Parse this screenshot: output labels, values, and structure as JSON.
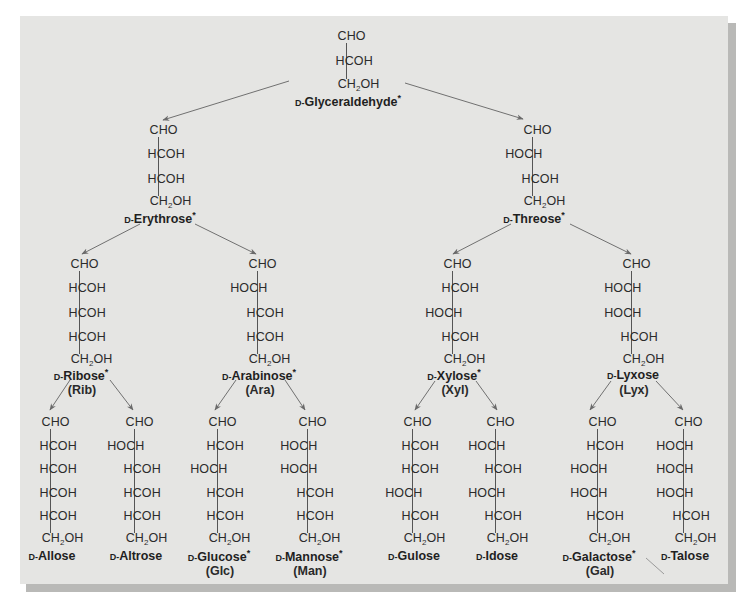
{
  "figure": {
    "colors": {
      "panel": "#e5e5e3",
      "shadow": "#b9b9b7",
      "text": "#2b2b2b",
      "arrow": "#707070"
    }
  },
  "molecules": [
    {
      "id": "glyceraldehyde",
      "prefix": "D-",
      "name": "Glyceraldehyde",
      "star": true,
      "abbr": "",
      "x": 346,
      "y0": 36,
      "dy": 25,
      "rows": [
        "CHO",
        "HCOH",
        "CH2OH"
      ]
    },
    {
      "id": "erythrose",
      "prefix": "D-",
      "name": "Erythrose",
      "star": true,
      "abbr": "",
      "x": 158,
      "y0": 130,
      "dy": 24.3,
      "rows": [
        "CHO",
        "HCOH",
        "HCOH",
        "CH2OH"
      ]
    },
    {
      "id": "threose",
      "prefix": "D-",
      "name": "Threose",
      "star": true,
      "abbr": "",
      "x": 532,
      "y0": 130,
      "dy": 24.3,
      "rows": [
        "CHO",
        "HOCH",
        "HCOH",
        "CH2OH"
      ]
    },
    {
      "id": "ribose",
      "prefix": "D-",
      "name": "Ribose",
      "star": true,
      "abbr": "(Rib)",
      "x": 79,
      "y0": 264,
      "dy": 24.3,
      "rows": [
        "CHO",
        "HCOH",
        "HCOH",
        "HCOH",
        "CH2OH"
      ]
    },
    {
      "id": "arabinose",
      "prefix": "D-",
      "name": "Arabinose",
      "star": true,
      "abbr": "(Ara)",
      "x": 257,
      "y0": 264,
      "dy": 24.3,
      "rows": [
        "CHO",
        "HOCH",
        "HCOH",
        "HCOH",
        "CH2OH"
      ]
    },
    {
      "id": "xylose",
      "prefix": "D-",
      "name": "Xylose",
      "star": true,
      "abbr": "(Xyl)",
      "x": 452,
      "y0": 264,
      "dy": 24.3,
      "rows": [
        "CHO",
        "HCOH",
        "HOCH",
        "HCOH",
        "CH2OH"
      ]
    },
    {
      "id": "lyxose",
      "prefix": "D-",
      "name": "Lyxose",
      "star": false,
      "abbr": "(Lyx)",
      "x": 631,
      "y0": 264,
      "dy": 24.3,
      "rows": [
        "CHO",
        "HOCH",
        "HOCH",
        "HCOH",
        "CH2OH"
      ]
    },
    {
      "id": "allose",
      "prefix": "D-",
      "name": "Allose",
      "star": false,
      "abbr": "",
      "x": 50,
      "y0": 422,
      "dy": 23.6,
      "rows": [
        "CHO",
        "HCOH",
        "HCOH",
        "HCOH",
        "HCOH",
        "CH2OH"
      ]
    },
    {
      "id": "altrose",
      "prefix": "D-",
      "name": "Altrose",
      "star": false,
      "abbr": "",
      "x": 134,
      "y0": 422,
      "dy": 23.6,
      "rows": [
        "CHO",
        "HOCH",
        "HCOH",
        "HCOH",
        "HCOH",
        "CH2OH"
      ]
    },
    {
      "id": "glucose",
      "prefix": "D-",
      "name": "Glucose",
      "star": true,
      "abbr": "(Glc)",
      "x": 217,
      "y0": 422,
      "dy": 23.6,
      "rows": [
        "CHO",
        "HCOH",
        "HOCH",
        "HCOH",
        "HCOH",
        "CH2OH"
      ]
    },
    {
      "id": "mannose",
      "prefix": "D-",
      "name": "Mannose",
      "star": true,
      "abbr": "(Man)",
      "x": 307,
      "y0": 422,
      "dy": 23.6,
      "rows": [
        "CHO",
        "HOCH",
        "HOCH",
        "HCOH",
        "HCOH",
        "CH2OH"
      ]
    },
    {
      "id": "gulose",
      "prefix": "D-",
      "name": "Gulose",
      "star": false,
      "abbr": "",
      "x": 412,
      "y0": 422,
      "dy": 23.6,
      "rows": [
        "CHO",
        "HCOH",
        "HCOH",
        "HOCH",
        "HCOH",
        "CH2OH"
      ]
    },
    {
      "id": "idose",
      "prefix": "D-",
      "name": "Idose",
      "star": false,
      "abbr": "",
      "x": 495,
      "y0": 422,
      "dy": 23.6,
      "rows": [
        "CHO",
        "HOCH",
        "HCOH",
        "HOCH",
        "HCOH",
        "CH2OH"
      ]
    },
    {
      "id": "galactose",
      "prefix": "D-",
      "name": "Galactose",
      "star": true,
      "abbr": "(Gal)",
      "x": 597,
      "y0": 422,
      "dy": 23.6,
      "rows": [
        "CHO",
        "HCOH",
        "HOCH",
        "HOCH",
        "HCOH",
        "CH2OH"
      ]
    },
    {
      "id": "talose",
      "prefix": "D-",
      "name": "Talose",
      "star": false,
      "abbr": "",
      "x": 683,
      "y0": 422,
      "dy": 23.6,
      "rows": [
        "CHO",
        "HOCH",
        "HOCH",
        "HOCH",
        "HCOH",
        "CH2OH"
      ]
    }
  ],
  "name_offsets": {
    "glyceraldehyde": 15,
    "erythrose": 15,
    "threose": 15,
    "pentose": 14,
    "hexose": 16,
    "abbr": 15
  },
  "arrows": [
    {
      "from": "glyceraldehyde",
      "to": "erythrose",
      "x1": 289,
      "y1": 81,
      "x2": 163,
      "y2": 120
    },
    {
      "from": "glyceraldehyde",
      "to": "threose",
      "x1": 405,
      "y1": 83,
      "x2": 523,
      "y2": 119
    },
    {
      "from": "erythrose",
      "to": "ribose",
      "x1": 140,
      "y1": 224,
      "x2": 82,
      "y2": 254
    },
    {
      "from": "erythrose",
      "to": "arabinose",
      "x1": 195,
      "y1": 224,
      "x2": 256,
      "y2": 254
    },
    {
      "from": "threose",
      "to": "xylose",
      "x1": 511,
      "y1": 224,
      "x2": 453,
      "y2": 254
    },
    {
      "from": "threose",
      "to": "lyxose",
      "x1": 570,
      "y1": 224,
      "x2": 631,
      "y2": 254
    },
    {
      "from": "ribose",
      "to": "allose",
      "x1": 70,
      "y1": 380,
      "x2": 50,
      "y2": 410
    },
    {
      "from": "ribose",
      "to": "altrose",
      "x1": 110,
      "y1": 380,
      "x2": 133,
      "y2": 410
    },
    {
      "from": "arabinose",
      "to": "glucose",
      "x1": 236,
      "y1": 380,
      "x2": 215,
      "y2": 410
    },
    {
      "from": "arabinose",
      "to": "mannose",
      "x1": 285,
      "y1": 380,
      "x2": 305,
      "y2": 410
    },
    {
      "from": "xylose",
      "to": "gulose",
      "x1": 435,
      "y1": 381,
      "x2": 415,
      "y2": 410
    },
    {
      "from": "xylose",
      "to": "idose",
      "x1": 476,
      "y1": 381,
      "x2": 497,
      "y2": 410
    },
    {
      "from": "lyxose",
      "to": "galactose",
      "x1": 611,
      "y1": 381,
      "x2": 590,
      "y2": 410
    },
    {
      "from": "lyxose",
      "to": "talose",
      "x1": 656,
      "y1": 381,
      "x2": 683,
      "y2": 410
    }
  ],
  "stray_mark": {
    "x1": 646,
    "y1": 558,
    "x2": 664,
    "y2": 574
  }
}
